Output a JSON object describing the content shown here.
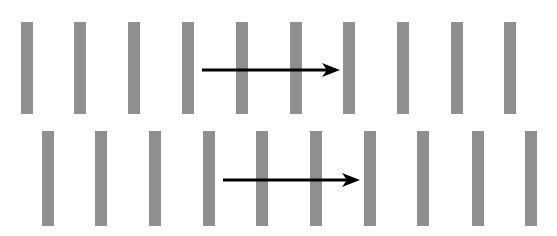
{
  "diagram": {
    "bar_color": "#8f8f8f",
    "arrow_color": "#000000",
    "bar_width": 12,
    "rows": [
      {
        "name": "top-row",
        "top": 22,
        "height": 92,
        "bar_x": [
          21,
          74,
          128,
          182,
          236,
          290,
          343,
          397,
          451,
          504
        ],
        "arrow": {
          "x1": 202,
          "x2": 340,
          "y": 70
        }
      },
      {
        "name": "bottom-row",
        "top": 131,
        "height": 95,
        "bar_x": [
          42,
          95,
          149,
          203,
          256,
          310,
          364,
          417,
          472,
          525
        ],
        "arrow": {
          "x1": 223,
          "x2": 360,
          "y": 180
        }
      }
    ]
  }
}
